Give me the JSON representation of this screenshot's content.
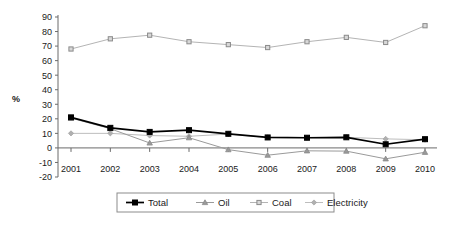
{
  "chart_data": {
    "type": "line",
    "title": "",
    "xlabel": "",
    "ylabel": "%",
    "categories": [
      "2001",
      "2002",
      "2003",
      "2004",
      "2005",
      "2006",
      "2007",
      "2008",
      "2009",
      "2010"
    ],
    "ylim": [
      -20,
      90
    ],
    "ytick_step": 10,
    "yticks": [
      90,
      80,
      70,
      60,
      50,
      40,
      30,
      20,
      10,
      0,
      -10,
      -20
    ],
    "grid": false,
    "legend_position": "bottom",
    "series": [
      {
        "name": "Total",
        "marker": "filled-square",
        "color": "#000000",
        "values": [
          21,
          13.8,
          11,
          12.2,
          9.7,
          7.2,
          7,
          7.3,
          2.5,
          6
        ]
      },
      {
        "name": "Oil",
        "marker": "triangle",
        "color": "#9a9a9a",
        "values": [
          20.5,
          13.2,
          3.4,
          7,
          -1.2,
          -5,
          -2,
          -2.2,
          -7.5,
          -3
        ]
      },
      {
        "name": "Coal",
        "marker": "square",
        "color": "#b4b4b4",
        "values": [
          68,
          75,
          77.5,
          73,
          71,
          69,
          73,
          76,
          72.5,
          84
        ]
      },
      {
        "name": "Electricity",
        "marker": "small-diamond",
        "color": "#bdbdbd",
        "values": [
          10,
          10,
          8.5,
          8,
          9.5,
          7.2,
          7,
          7.3,
          6.2,
          5.6
        ]
      }
    ]
  },
  "axis": {
    "y_label": "%",
    "y_tick_labels": [
      "90",
      "80",
      "70",
      "60",
      "50",
      "40",
      "30",
      "20",
      "10",
      "0",
      "-10",
      "-20"
    ],
    "x_tick_labels": [
      "2001",
      "2002",
      "2003",
      "2004",
      "2005",
      "2006",
      "2007",
      "2008",
      "2009",
      "2010"
    ]
  },
  "legend": {
    "items": [
      {
        "label": "Total"
      },
      {
        "label": "Oil"
      },
      {
        "label": "Coal"
      },
      {
        "label": "Electricity"
      }
    ]
  }
}
